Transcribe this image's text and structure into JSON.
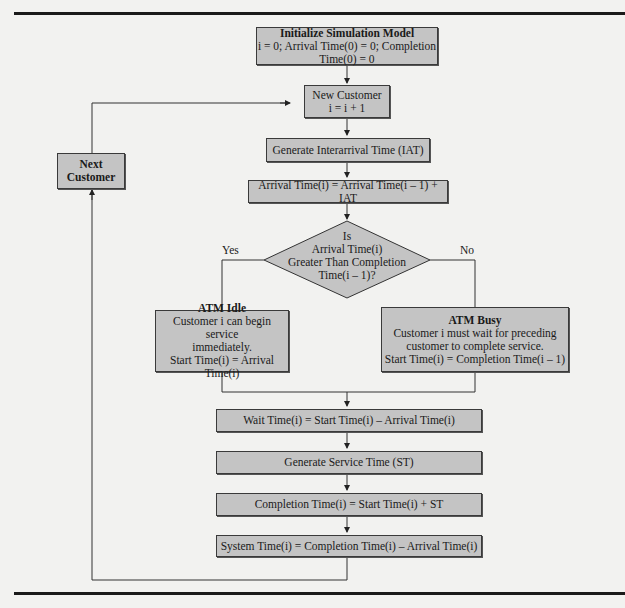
{
  "diagram": {
    "init": {
      "title": "Initialize Simulation Model",
      "line": "i = 0; Arrival Time(0) = 0; Completion Time(0) = 0"
    },
    "new_customer": {
      "title": "New Customer",
      "line": "i = i + 1"
    },
    "next_customer": {
      "line1": "Next",
      "line2": "Customer"
    },
    "generate_iat": "Generate Interarrival Time (IAT)",
    "arrival_time": "Arrival Time(i) = Arrival Time(i – 1) + IAT",
    "decision": {
      "line1": "Is",
      "line2": "Arrival Time(i)",
      "line3": "Greater Than Completion",
      "line4": "Time(i – 1)?",
      "yes_label": "Yes",
      "no_label": "No"
    },
    "atm_idle": {
      "title": "ATM Idle",
      "line1": "Customer i can begin service",
      "line2": "immediately.",
      "line3": "Start Time(i) = Arrival Time(i)"
    },
    "atm_busy": {
      "title": "ATM Busy",
      "line1": "Customer i must wait for preceding",
      "line2": "customer to complete service.",
      "line3": "Start Time(i) = Completion Time(i – 1)"
    },
    "wait_time": "Wait Time(i) = Start Time(i) – Arrival Time(i)",
    "generate_st": "Generate Service Time (ST)",
    "completion_time": "Completion Time(i) = Start Time(i) + ST",
    "system_time": "System Time(i) = Completion Time(i) – Arrival Time(i)"
  }
}
